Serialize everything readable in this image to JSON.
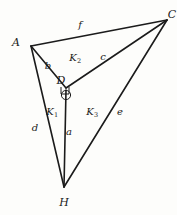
{
  "figure": {
    "kind": "geometry-diagram",
    "stroke_color": "#1b1b1b",
    "background_color": "#fdfdfb",
    "width": 177,
    "height": 215,
    "vertices": [
      {
        "id": "A",
        "label": "A",
        "x": 31,
        "y": 46,
        "label_x": 16,
        "label_y": 42
      },
      {
        "id": "C",
        "label": "C",
        "x": 167,
        "y": 20,
        "label_x": 172,
        "label_y": 14
      },
      {
        "id": "D",
        "label": "D",
        "x": 66,
        "y": 88,
        "label_x": 61,
        "label_y": 80
      },
      {
        "id": "H",
        "label": "H",
        "x": 64,
        "y": 187,
        "label_x": 64,
        "label_y": 202
      }
    ],
    "edges": [
      {
        "id": "f",
        "label": "f",
        "from": "A",
        "to": "C",
        "label_x": 80,
        "label_y": 25
      },
      {
        "id": "b",
        "label": "b",
        "from": "A",
        "to": "D",
        "label_x": 48,
        "label_y": 66
      },
      {
        "id": "c",
        "label": "c",
        "from": "D",
        "to": "C",
        "label_x": 103,
        "label_y": 57
      },
      {
        "id": "d",
        "label": "d",
        "from": "A",
        "to": "H",
        "label_x": 35,
        "label_y": 128
      },
      {
        "id": "a",
        "label": "a",
        "from": "D",
        "to": "H",
        "label_x": 69,
        "label_y": 132
      },
      {
        "id": "e",
        "label": "e",
        "from": "H",
        "to": "C",
        "label_x": 120,
        "label_y": 112
      }
    ],
    "regions": [
      {
        "id": "K1",
        "label": "K",
        "subscript": "1",
        "label_x": 52,
        "label_y": 112
      },
      {
        "id": "K2",
        "label": "K",
        "subscript": "2",
        "label_x": 75,
        "label_y": 58
      },
      {
        "id": "K3",
        "label": "K",
        "subscript": "3",
        "label_x": 92,
        "label_y": 112
      }
    ],
    "markers": [
      {
        "id": "right-angle-at-D",
        "type": "right-angle-square",
        "x": 66,
        "y": 91,
        "size": 8
      },
      {
        "id": "arc-at-D",
        "type": "small-circle",
        "x": 66,
        "y": 95,
        "r": 5
      }
    ]
  }
}
